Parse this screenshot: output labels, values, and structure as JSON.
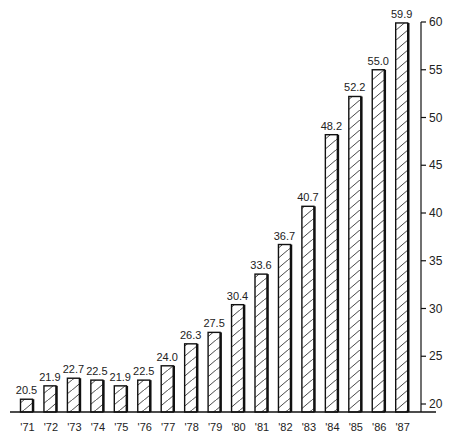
{
  "chart_data": {
    "type": "bar",
    "title": "",
    "xlabel": "",
    "ylabel": "",
    "categories": [
      "'71",
      "'72",
      "'73",
      "'74",
      "'75",
      "'76",
      "'77",
      "'78",
      "'79",
      "'80",
      "'81",
      "'82",
      "'83",
      "'84",
      "'85",
      "'86",
      "'87"
    ],
    "values": [
      20.5,
      21.9,
      22.7,
      22.5,
      21.9,
      22.5,
      24.0,
      26.3,
      27.5,
      30.4,
      33.6,
      36.7,
      40.7,
      48.2,
      52.2,
      55.0,
      59.9
    ],
    "value_labels": [
      "20.5",
      "21.9",
      "22.7",
      "22.5",
      "21.9",
      "22.5",
      "24.0",
      "26.3",
      "27.5",
      "30.4",
      "33.6",
      "36.7",
      "40.7",
      "48.2",
      "52.2",
      "55.0",
      "59.9"
    ],
    "ylim": [
      19,
      60
    ],
    "yticks": [
      20,
      25,
      30,
      35,
      40,
      45,
      50,
      55,
      60
    ],
    "ytick_labels": [
      "20",
      "25",
      "30",
      "35",
      "40",
      "45",
      "50",
      "55",
      "60"
    ],
    "y_axis_position": "right",
    "grid": false,
    "legend": null,
    "bar_fill": "diagonal-hatch",
    "colors": {
      "stroke": "#111111",
      "background": "#ffffff"
    }
  }
}
